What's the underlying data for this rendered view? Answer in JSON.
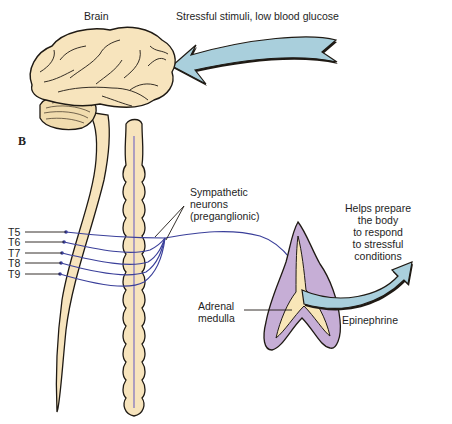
{
  "figure": {
    "panel_label": "B",
    "labels": {
      "brain": "Brain",
      "stimulus": "Stressful stimuli, low blood glucose",
      "neurons_line1": "Sympathetic",
      "neurons_line2": "neurons",
      "neurons_line3": "(preganglionic)",
      "adrenal_line1": "Adrenal",
      "adrenal_line2": "medulla",
      "hormone": "Epinephrine",
      "effect_line1": "Helps prepare",
      "effect_line2": "the body",
      "effect_line3": "to respond",
      "effect_line4": "to stressful",
      "effect_line5": "conditions"
    },
    "spinal_levels": [
      "T5",
      "T6",
      "T7",
      "T8",
      "T9"
    ],
    "colors": {
      "tissue": "#f7e4bd",
      "outline": "#1f1a14",
      "nerve": "#3a3f9a",
      "arrow_fill": "#a9cfdc",
      "adrenal_cortex": "#c6aed6",
      "adrenal_medulla": "#f8e6b8"
    }
  }
}
